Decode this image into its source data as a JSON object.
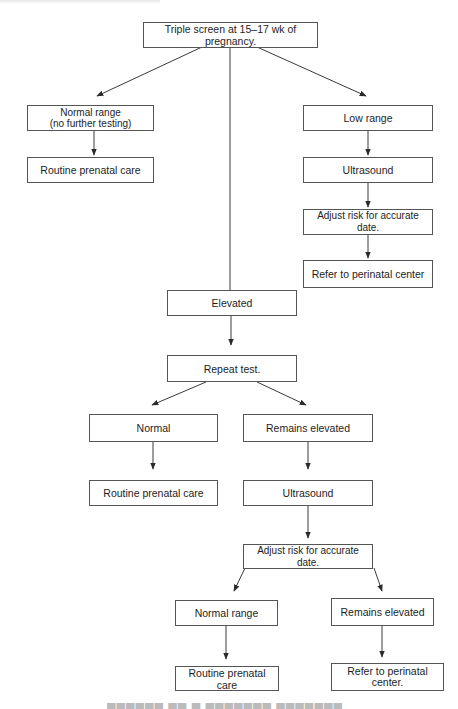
{
  "figure": {
    "type": "flowchart",
    "caption_visible": false,
    "nodes": {
      "start": "Triple screen at 15–17 wk of pregnancy.",
      "normal_range": "Normal range\n(no further testing)",
      "normal_routine": "Routine prenatal care",
      "low_range": "Low range",
      "low_ultrasound": "Ultrasound",
      "low_adjust": "Adjust risk for accurate date.",
      "low_refer": "Refer to perinatal center",
      "elevated": "Elevated",
      "repeat_test": "Repeat test.",
      "repeat_normal": "Normal",
      "repeat_normal_routine": "Routine prenatal care",
      "remains_elevated": "Remains elevated",
      "elev_ultrasound": "Ultrasound",
      "elev_adjust": "Adjust risk for accurate date.",
      "final_normal_range": "Normal range",
      "final_routine": "Routine prenatal care",
      "final_remains_elevated": "Remains elevated",
      "final_refer": "Refer to perinatal\ncenter."
    },
    "edges": [
      [
        "start",
        "normal_range"
      ],
      [
        "start",
        "elevated"
      ],
      [
        "start",
        "low_range"
      ],
      [
        "normal_range",
        "normal_routine"
      ],
      [
        "low_range",
        "low_ultrasound"
      ],
      [
        "low_ultrasound",
        "low_adjust"
      ],
      [
        "low_adjust",
        "low_refer"
      ],
      [
        "elevated",
        "repeat_test"
      ],
      [
        "repeat_test",
        "repeat_normal"
      ],
      [
        "repeat_test",
        "remains_elevated"
      ],
      [
        "repeat_normal",
        "repeat_normal_routine"
      ],
      [
        "remains_elevated",
        "elev_ultrasound"
      ],
      [
        "elev_ultrasound",
        "elev_adjust"
      ],
      [
        "elev_adjust",
        "final_normal_range"
      ],
      [
        "elev_adjust",
        "final_remains_elevated"
      ],
      [
        "final_normal_range",
        "final_routine"
      ],
      [
        "final_remains_elevated",
        "final_refer"
      ]
    ],
    "colors": {
      "line": "#3a3a3a",
      "box_border": "#555555",
      "text": "#1d1d1d",
      "background": "#ffffff"
    }
  }
}
